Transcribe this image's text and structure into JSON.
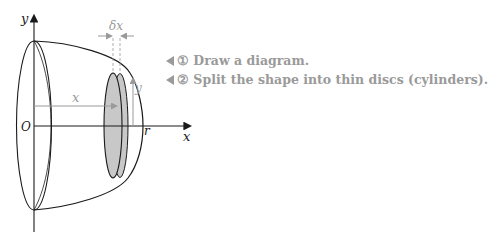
{
  "diagram": {
    "labels": {
      "y_axis": "y",
      "x_axis": "x",
      "origin": "O",
      "radius": "r",
      "distance": "x",
      "height": "y",
      "thickness": "δx"
    },
    "colors": {
      "stroke": "#1a1a1a",
      "annotation": "#9a9a9a",
      "disc_fill": "#c8c8c8"
    }
  },
  "notes": [
    {
      "marker": "①",
      "text": "Draw a diagram."
    },
    {
      "marker": "②",
      "text": "Split the shape into thin discs (cylinders)."
    }
  ]
}
